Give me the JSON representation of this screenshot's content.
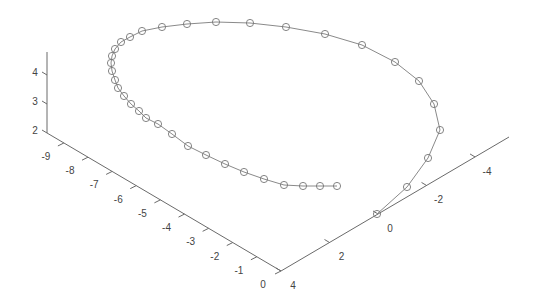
{
  "chart_data": {
    "type": "line",
    "subtype": "3d-line-with-markers",
    "title": "",
    "xlabel": "",
    "ylabel": "",
    "zlabel": "",
    "x_axis": {
      "ticks": [
        "0",
        "-1",
        "-2",
        "-3",
        "-4",
        "-5",
        "-6",
        "-7",
        "-8",
        "-9"
      ],
      "range": [
        -9.5,
        0
      ]
    },
    "y_axis": {
      "ticks": [
        "4",
        "2",
        "0",
        "-2",
        "-4"
      ],
      "range": [
        -5,
        4
      ]
    },
    "z_axis": {
      "ticks": [
        "2",
        "3",
        "4"
      ],
      "range": [
        2,
        4.8
      ]
    },
    "grid": false,
    "legend": null,
    "marker": "circle",
    "series": [
      {
        "name": "spiral",
        "points_screen_order": "starts at origin (0,0), curls up and around, ends near x=-3",
        "point_count": 39
      }
    ]
  }
}
